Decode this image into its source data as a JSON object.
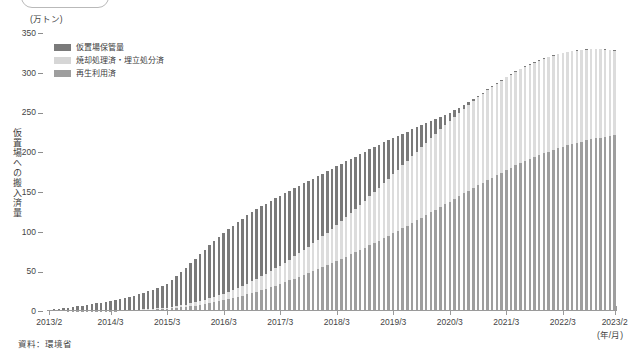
{
  "title_badge": {
    "label": ""
  },
  "axis": {
    "y_unit": "(万トン)",
    "y_title": "仮置場への搬入済量",
    "x_unit": "(年/月)"
  },
  "legend": {
    "items": [
      {
        "label": "仮置場保管量",
        "color": "#7a7a7a"
      },
      {
        "label": "焼却処理済・埋立処分済",
        "color": "#d6d6d6"
      },
      {
        "label": "再生利用済",
        "color": "#9e9e9e"
      }
    ]
  },
  "source": {
    "text": "資料：環境省"
  },
  "chart_data": {
    "type": "bar",
    "stacked": true,
    "title": "仮置場への搬入済量",
    "xlabel": "(年/月)",
    "ylabel": "仮置場への搬入済量",
    "yunit": "万トン",
    "ylim": [
      0,
      350
    ],
    "yticks": [
      0,
      50,
      100,
      150,
      200,
      250,
      300,
      350
    ],
    "grid": false,
    "legend_position": "top-left",
    "x_tick_labels": [
      "2013/2",
      "2014/3",
      "2015/3",
      "2016/3",
      "2017/3",
      "2018/3",
      "2019/3",
      "2020/3",
      "2021/3",
      "2022/3",
      "2023/2"
    ],
    "x_tick_indices": [
      0,
      13,
      25,
      37,
      49,
      61,
      73,
      85,
      97,
      109,
      120
    ],
    "categories": [
      "2013/2",
      "2013/3",
      "2013/4",
      "2013/5",
      "2013/6",
      "2013/7",
      "2013/8",
      "2013/9",
      "2013/10",
      "2013/11",
      "2013/12",
      "2014/1",
      "2014/2",
      "2014/3",
      "2014/4",
      "2014/5",
      "2014/6",
      "2014/7",
      "2014/8",
      "2014/9",
      "2014/10",
      "2014/11",
      "2014/12",
      "2015/1",
      "2015/2",
      "2015/3",
      "2015/4",
      "2015/5",
      "2015/6",
      "2015/7",
      "2015/8",
      "2015/9",
      "2015/10",
      "2015/11",
      "2015/12",
      "2016/1",
      "2016/2",
      "2016/3",
      "2016/4",
      "2016/5",
      "2016/6",
      "2016/7",
      "2016/8",
      "2016/9",
      "2016/10",
      "2016/11",
      "2016/12",
      "2017/1",
      "2017/2",
      "2017/3",
      "2017/4",
      "2017/5",
      "2017/6",
      "2017/7",
      "2017/8",
      "2017/9",
      "2017/10",
      "2017/11",
      "2017/12",
      "2018/1",
      "2018/2",
      "2018/3",
      "2018/4",
      "2018/5",
      "2018/6",
      "2018/7",
      "2018/8",
      "2018/9",
      "2018/10",
      "2018/11",
      "2018/12",
      "2019/1",
      "2019/2",
      "2019/3",
      "2019/4",
      "2019/5",
      "2019/6",
      "2019/7",
      "2019/8",
      "2019/9",
      "2019/10",
      "2019/11",
      "2019/12",
      "2020/1",
      "2020/2",
      "2020/3",
      "2020/4",
      "2020/5",
      "2020/6",
      "2020/7",
      "2020/8",
      "2020/9",
      "2020/10",
      "2020/11",
      "2020/12",
      "2021/1",
      "2021/2",
      "2021/3",
      "2021/4",
      "2021/5",
      "2021/6",
      "2021/7",
      "2021/8",
      "2021/9",
      "2021/10",
      "2021/11",
      "2021/12",
      "2022/1",
      "2022/2",
      "2022/3",
      "2022/4",
      "2022/5",
      "2022/6",
      "2022/7",
      "2022/8",
      "2022/9",
      "2022/10",
      "2022/11",
      "2022/12",
      "2023/1",
      "2023/2"
    ],
    "series": [
      {
        "name": "再生利用済",
        "color": "#9e9e9e",
        "values": [
          0.0,
          0.0,
          0.0,
          0.0,
          0.1,
          0.1,
          0.1,
          0.2,
          0.2,
          0.3,
          0.3,
          0.4,
          0.4,
          0.5,
          0.6,
          0.7,
          0.8,
          0.9,
          1.0,
          1.2,
          1.4,
          1.6,
          1.8,
          2.1,
          2.4,
          2.8,
          3.3,
          3.9,
          4.5,
          5.2,
          6.0,
          6.9,
          7.8,
          8.8,
          9.9,
          11.0,
          12.2,
          13.5,
          14.9,
          16.3,
          17.8,
          19.4,
          21.0,
          22.7,
          24.5,
          26.3,
          28.2,
          30.1,
          32.1,
          34.2,
          36.3,
          38.5,
          40.7,
          43.0,
          45.3,
          47.7,
          50.1,
          52.6,
          55.1,
          57.7,
          60.3,
          63.0,
          65.7,
          68.4,
          71.2,
          74.0,
          76.9,
          79.8,
          82.7,
          85.7,
          88.7,
          91.8,
          94.9,
          98.0,
          101.2,
          104.4,
          107.6,
          110.9,
          114.2,
          117.5,
          120.8,
          124.2,
          127.6,
          131.0,
          134.4,
          137.8,
          141.2,
          144.6,
          148.0,
          151.4,
          154.8,
          158.2,
          161.5,
          164.8,
          168.0,
          171.2,
          174.3,
          177.4,
          180.4,
          183.3,
          186.1,
          188.8,
          191.4,
          193.9,
          196.3,
          198.6,
          200.8,
          202.9,
          204.9,
          206.8,
          208.6,
          210.3,
          211.9,
          213.4,
          214.8,
          216.1,
          217.3,
          218.4,
          219.4,
          220.3,
          221.0
        ]
      },
      {
        "name": "焼却処理済・埋立処分済",
        "color": "#dcdcdc",
        "values": [
          0.0,
          0.0,
          0.0,
          0.0,
          0.0,
          0.0,
          0.0,
          0.0,
          0.1,
          0.1,
          0.1,
          0.1,
          0.2,
          0.2,
          0.3,
          0.3,
          0.4,
          0.5,
          0.6,
          0.7,
          0.8,
          0.9,
          1.0,
          1.2,
          1.4,
          1.6,
          1.9,
          2.2,
          2.6,
          3.0,
          3.5,
          4.0,
          4.6,
          5.2,
          5.9,
          6.6,
          7.4,
          8.3,
          9.2,
          10.2,
          11.2,
          12.3,
          13.5,
          14.7,
          16.0,
          17.3,
          18.7,
          20.1,
          21.6,
          23.1,
          24.7,
          26.3,
          28.0,
          29.7,
          31.5,
          33.3,
          35.2,
          37.1,
          39.1,
          41.1,
          43.2,
          45.3,
          47.5,
          49.7,
          52.0,
          54.3,
          56.7,
          59.1,
          61.5,
          64.0,
          66.5,
          69.0,
          71.5,
          74.0,
          76.5,
          79.0,
          81.5,
          84.0,
          86.4,
          88.8,
          91.1,
          93.4,
          95.6,
          97.7,
          99.7,
          101.6,
          103.4,
          105.1,
          106.7,
          108.2,
          109.6,
          110.9,
          112.1,
          113.2,
          114.2,
          115.1,
          115.9,
          116.6,
          117.2,
          117.7,
          118.1,
          118.4,
          118.6,
          118.7,
          118.8,
          118.8,
          118.7,
          118.5,
          118.2,
          117.8,
          117.3,
          116.7,
          116.0,
          115.2,
          114.3,
          113.3,
          112.2,
          111.0,
          109.7,
          108.3,
          106.8
        ]
      },
      {
        "name": "仮置場保管量",
        "color": "#7a7a7a",
        "values": [
          1.6,
          2.1,
          2.6,
          3.2,
          3.9,
          4.7,
          5.6,
          6.6,
          7.5,
          8.4,
          9.2,
          10.0,
          10.8,
          11.6,
          12.6,
          13.7,
          14.9,
          16.2,
          17.6,
          19.0,
          20.5,
          22.1,
          23.8,
          25.7,
          27.8,
          30.2,
          33.5,
          37.4,
          41.8,
          46.3,
          50.8,
          55.2,
          59.4,
          63.4,
          67.1,
          70.5,
          73.6,
          76.4,
          78.9,
          81.1,
          83.0,
          84.6,
          85.9,
          86.9,
          87.6,
          88.1,
          88.3,
          88.3,
          88.1,
          87.7,
          87.2,
          86.5,
          85.7,
          84.8,
          83.8,
          82.7,
          81.5,
          80.2,
          78.8,
          77.3,
          75.7,
          74.0,
          72.2,
          70.3,
          68.3,
          66.2,
          64.0,
          61.7,
          59.3,
          56.8,
          54.2,
          51.5,
          48.7,
          45.8,
          42.9,
          39.9,
          36.9,
          33.8,
          30.7,
          27.6,
          24.5,
          21.4,
          18.4,
          15.5,
          12.8,
          10.3,
          8.1,
          6.2,
          4.6,
          3.4,
          2.5,
          1.9,
          1.5,
          1.2,
          1.0,
          0.9,
          0.8,
          0.8,
          0.7,
          0.7,
          0.7,
          0.7,
          0.6,
          0.6,
          0.6,
          0.6,
          0.6,
          0.6,
          0.5,
          0.5,
          0.5,
          0.5,
          0.5,
          0.5,
          0.5,
          0.4,
          0.4,
          0.4,
          0.4,
          0.4,
          0.4
        ]
      }
    ],
    "totals_note": "総搬入済量は2013/2の約1.6万トンから2023/2の約328万トンまで増加"
  }
}
